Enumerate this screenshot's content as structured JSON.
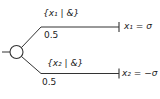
{
  "figure": {
    "type": "branching-diagram",
    "background_color": "#ffffff",
    "line_color": "#333333",
    "node": {
      "shape": "open-circle"
    },
    "branches": [
      {
        "label": "{x₁ | &}",
        "probability": "0.5",
        "outcome": "x₁ = σ"
      },
      {
        "label": "{x₂ | &}",
        "probability": "0.5",
        "outcome": "x₂ = −σ"
      }
    ]
  }
}
